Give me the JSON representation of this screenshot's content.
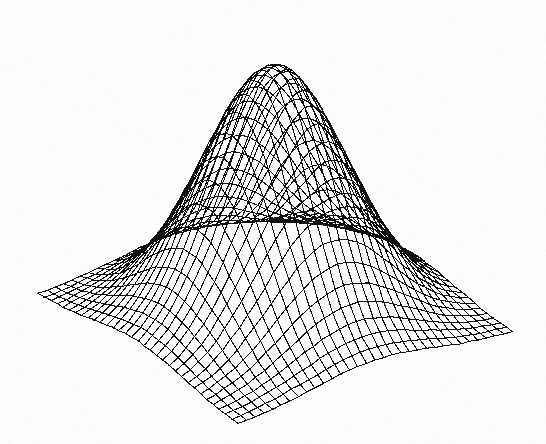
{
  "figure": {
    "kind": "3d-wireframe-surface-plot",
    "title": "",
    "background_color": "#ffffff",
    "line_color": "#111111",
    "canvas": {
      "width": 546,
      "height": 444
    }
  },
  "chart_data": {
    "type": "surface",
    "title": "",
    "subtitle": "",
    "xlabel": "",
    "ylabel": "",
    "zlabel": "",
    "grid": true,
    "legend": false,
    "legend_position": "none",
    "axes_visible": false,
    "tick_labels": [],
    "annotations": [],
    "function": "z = A * exp(-((x^2 + y^2) / (2 * sigma^2)))",
    "amplitude": 1.0,
    "sigma": 0.22,
    "center": [
      0.5,
      0.5
    ],
    "baseline": 0.0,
    "xlim": [
      0,
      1
    ],
    "ylim": [
      0,
      1
    ],
    "zlim": [
      0,
      1
    ],
    "grid_divisions_x": 32,
    "grid_divisions_y": 32,
    "projection": {
      "type": "oblique-parallel",
      "corner_left_px": [
        38,
        295
      ],
      "corner_front_px": [
        238,
        425
      ],
      "corner_right_px": [
        512,
        333
      ],
      "corner_back_px": [
        312,
        211
      ],
      "peak_apex_px": [
        275,
        38
      ],
      "z_height_px": 250
    },
    "x": [
      0,
      0.0625,
      0.125,
      0.1875,
      0.25,
      0.3125,
      0.375,
      0.4375,
      0.5,
      0.5625,
      0.625,
      0.6875,
      0.75,
      0.8125,
      0.875,
      0.9375,
      1
    ],
    "y": [
      0,
      0.0625,
      0.125,
      0.1875,
      0.25,
      0.3125,
      0.375,
      0.4375,
      0.5,
      0.5625,
      0.625,
      0.6875,
      0.75,
      0.8125,
      0.875,
      0.9375,
      1
    ],
    "z_profile_center_row": [
      0.001,
      0.003,
      0.01,
      0.031,
      0.082,
      0.187,
      0.362,
      0.6,
      0.85,
      1.0,
      0.85,
      0.6,
      0.362,
      0.187,
      0.082,
      0.031,
      0.01
    ],
    "series": [
      {
        "name": "gaussian-surface",
        "values": [
          0.001,
          0.003,
          0.01,
          0.031,
          0.082,
          0.187,
          0.362,
          0.6,
          0.85,
          1.0,
          0.85,
          0.6,
          0.362,
          0.187,
          0.082,
          0.031,
          0.01
        ]
      }
    ]
  }
}
